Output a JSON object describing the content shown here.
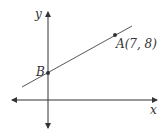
{
  "diagram": {
    "axes": {
      "x_label": "x",
      "y_label": "y"
    },
    "points": [
      {
        "name": "A",
        "label": "A(7, 8)",
        "coords": [
          7,
          8
        ]
      },
      {
        "name": "B",
        "label": "B"
      }
    ],
    "line": {
      "through": [
        "B",
        "A"
      ]
    },
    "colors": {
      "stroke": "#333333",
      "background": "#ffffff"
    }
  }
}
